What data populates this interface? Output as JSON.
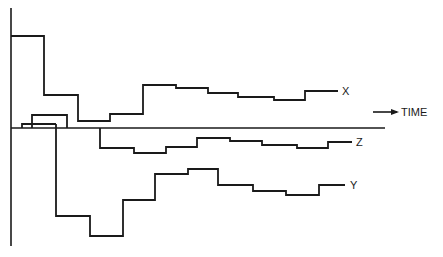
{
  "diagram": {
    "axes": {
      "time_label": "TIME",
      "time_arrow": "right-arrow-icon",
      "vertical_axis": {
        "x": 11,
        "y_top": 8,
        "y_bottom": 246
      },
      "time_axis": {
        "y": 128,
        "x_start": 11,
        "x_end": 385
      }
    },
    "series": [
      {
        "name": "X",
        "label": "X",
        "points": "11,36 44,36 44,95 78,95 78,121 110,121 110,114 143,114 143,85 176,85 176,88 208,88 208,93 238,93 238,97 274,97 274,100 305,100 305,91 338,91"
      },
      {
        "name": "Z",
        "label": "Z",
        "points": "100,128 100,148 134,148 134,153 166,153 166,147 197,147 197,138 230,138 230,141 262,141 262,145 297,145 297,148 328,148 328,142 352,142"
      },
      {
        "name": "Y",
        "label": "Y",
        "points": "56,124 56,216 90,216 90,236 123,236 123,200 155,200 155,174 188,174 188,169 218,169 218,185 253,185 253,191 286,191 286,195 319,195 319,185 345,185"
      }
    ],
    "initial_pulses": [
      {
        "name": "pulse-small",
        "points": "22,128 22,124 56,124"
      },
      {
        "name": "pulse-tall",
        "points": "32,128 32,115 67,115 67,128"
      }
    ],
    "labels": {
      "x": {
        "text": "X",
        "left": 342,
        "top": 86
      },
      "z": {
        "text": "Z",
        "left": 356,
        "top": 137
      },
      "y": {
        "text": "Y",
        "left": 350,
        "top": 180
      },
      "time": {
        "text": "TIME",
        "left": 401,
        "top": 111
      }
    }
  }
}
